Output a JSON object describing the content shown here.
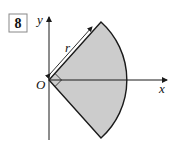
{
  "problem": {
    "number": "8"
  },
  "diagram": {
    "axes": {
      "x_label": "x",
      "y_label": "y",
      "origin_label": "O"
    },
    "sector": {
      "radius_label": "r",
      "angle": "right angle",
      "fill_color": "#cccccc",
      "stroke_color": "#1a1a1a"
    }
  }
}
